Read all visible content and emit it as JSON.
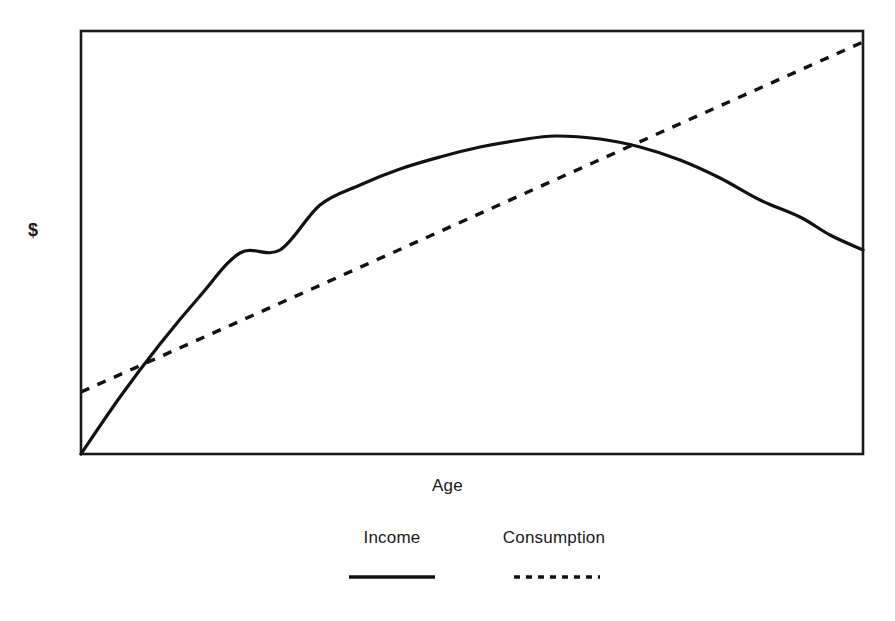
{
  "chart_data": {
    "type": "line",
    "title": "",
    "subtitle": "",
    "xlabel": "Age",
    "ylabel": "$",
    "grid": false,
    "legend_position": "bottom",
    "xlim": [
      0,
      100
    ],
    "ylim": [
      0,
      100
    ],
    "axis_ticks": {
      "x": [],
      "y": []
    },
    "annotations": [],
    "series": [
      {
        "name": "Income",
        "style": "solid",
        "color": "#111111",
        "shape": "inverted-parabola",
        "description": "Rises steeply from origin, peaks near middle of age range, then declines",
        "x": [
          0,
          5,
          10,
          15,
          20,
          25,
          30,
          35,
          40,
          45,
          50,
          55,
          60,
          65,
          70,
          75,
          80,
          85,
          90,
          95,
          100
        ],
        "y": [
          0,
          13.5,
          26,
          37.5,
          48,
          57.5,
          66,
          73.5,
          80,
          85.5,
          90,
          93.5,
          96,
          97.5,
          98,
          97.5,
          96,
          93.5,
          90,
          85.5,
          80
        ],
        "points_px": [
          [
            81,
            454
          ],
          [
            120,
            397
          ],
          [
            160,
            344
          ],
          [
            200,
            296
          ],
          [
            240,
            253
          ],
          [
            280,
            250
          ],
          [
            320,
            205
          ],
          [
            360,
            185
          ],
          [
            400,
            169
          ],
          [
            440,
            157
          ],
          [
            480,
            147
          ],
          [
            520,
            140
          ],
          [
            555,
            136
          ],
          [
            600,
            139
          ],
          [
            640,
            147
          ],
          [
            680,
            160
          ],
          [
            720,
            178
          ],
          [
            760,
            200
          ],
          [
            800,
            217
          ],
          [
            830,
            235
          ],
          [
            863,
            250
          ]
        ]
      },
      {
        "name": "Consumption",
        "style": "dashed",
        "color": "#111111",
        "shape": "linear",
        "description": "Straight upward-sloping line from a positive intercept to the top right",
        "x": [
          0,
          25,
          50,
          75,
          100
        ],
        "y": [
          15,
          36.5,
          58,
          79.5,
          101
        ],
        "points_px": [
          [
            81,
            392
          ],
          [
            276,
            305
          ],
          [
            470,
            218
          ],
          [
            666,
            130
          ],
          [
            863,
            42
          ]
        ]
      }
    ],
    "intersections_px": [
      [
        170,
        354
      ],
      [
        637,
        146
      ]
    ]
  },
  "figure": {
    "y_axis_label": "$",
    "x_axis_label": "Age",
    "background_color": "#ffffff",
    "line_color": "#111111",
    "frame_color": "#1a1a1a"
  },
  "legend": {
    "entries": [
      {
        "label": "Income",
        "style": "solid"
      },
      {
        "label": "Consumption",
        "style": "dashed"
      }
    ]
  }
}
